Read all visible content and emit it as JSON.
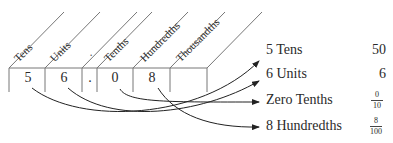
{
  "place_value_chart": {
    "headers": [
      "Tens",
      "Units",
      ".",
      "Tenths",
      "Hundredths",
      "Thousandths"
    ],
    "digits": [
      "5",
      "6",
      ".",
      "0",
      "8",
      ""
    ]
  },
  "expansion": [
    {
      "label": "5 Tens",
      "value": "50"
    },
    {
      "label": "6 Units",
      "value": "6"
    },
    {
      "label": "Zero Tenths",
      "numerator": "0",
      "denominator": "10"
    },
    {
      "label": "8 Hundredths",
      "numerator": "8",
      "denominator": "100"
    }
  ]
}
